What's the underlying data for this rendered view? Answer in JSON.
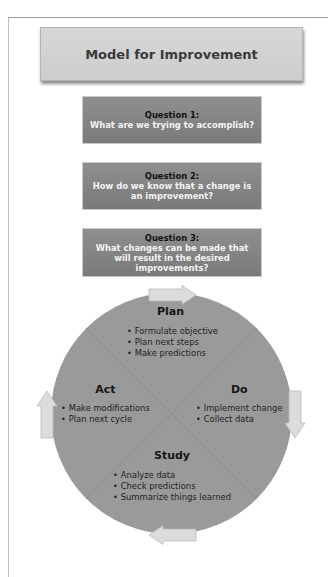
{
  "header": {
    "title": "Model for Improvement"
  },
  "questions": [
    {
      "label": "Question 1:",
      "text": "What are we trying to accomplish?"
    },
    {
      "label": "Question 2:",
      "text": "How do we know that a change is an improvement?"
    },
    {
      "label": "Question 3:",
      "text": "What changes can be made that will result in the desired improvements?"
    }
  ],
  "cycle": {
    "plan": {
      "title": "Plan",
      "items": [
        "Formulate objective",
        "Plan next steps",
        "Make predictions"
      ]
    },
    "do": {
      "title": "Do",
      "items": [
        "Implement change",
        "Collect data"
      ]
    },
    "study": {
      "title": "Study",
      "items": [
        "Analyze data",
        "Check predictions",
        "Summarize things learned"
      ]
    },
    "act": {
      "title": "Act",
      "items": [
        "Make modifications",
        "Plan next cycle"
      ]
    }
  },
  "arrows": {
    "top": "arrow-right-icon",
    "right": "arrow-down-icon",
    "bottom": "arrow-left-icon",
    "left": "arrow-up-icon"
  },
  "colors": {
    "header_bg": "#d3d3d3",
    "question_bg": "#858585",
    "circle_bg": "#9a9a9a",
    "arrow_fill": "#dcdcdc"
  }
}
